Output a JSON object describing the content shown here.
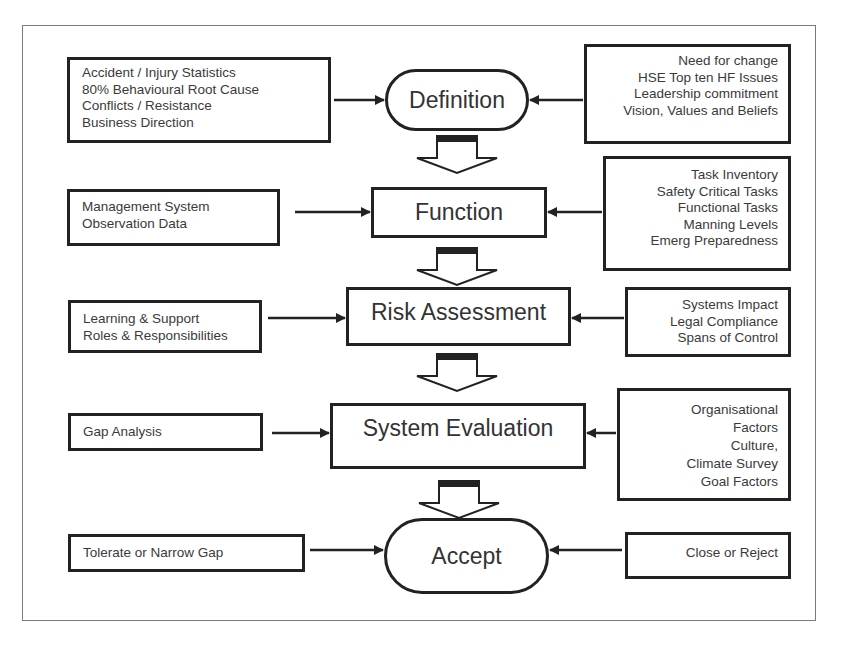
{
  "diagram": {
    "stages": [
      {
        "id": "definition",
        "label": "Definition",
        "shape": "pill",
        "left_inputs": [
          "Accident / Injury Statistics",
          "80% Behavioural Root Cause",
          "Conflicts / Resistance",
          "Business Direction"
        ],
        "right_inputs": [
          "Need for change",
          "HSE Top ten HF Issues",
          "Leadership commitment",
          "Vision, Values and Beliefs"
        ]
      },
      {
        "id": "function",
        "label": "Function",
        "shape": "rect",
        "left_inputs": [
          "Management System",
          "Observation Data"
        ],
        "right_inputs": [
          "Task Inventory",
          "Safety Critical Tasks",
          "Functional Tasks",
          "Manning Levels",
          "Emerg Preparedness"
        ]
      },
      {
        "id": "risk-assessment",
        "label": "Risk Assessment",
        "shape": "rect",
        "left_inputs": [
          "Learning & Support",
          "Roles & Responsibilities"
        ],
        "right_inputs": [
          "Systems Impact",
          "Legal Compliance",
          "Spans of Control"
        ]
      },
      {
        "id": "system-evaluation",
        "label": "System Evaluation",
        "shape": "rect",
        "left_inputs": [
          "Gap Analysis"
        ],
        "right_inputs": [
          "Organisational",
          "Factors",
          "Culture,",
          "Climate Survey",
          "Goal Factors"
        ]
      },
      {
        "id": "accept",
        "label": "Accept",
        "shape": "pill",
        "left_inputs": [
          "Tolerate or Narrow Gap"
        ],
        "right_inputs": [
          "Close or Reject"
        ]
      }
    ],
    "colors": {
      "stroke": "#222222",
      "text": "#333333",
      "frame": "#7a7a7a",
      "background": "#ffffff"
    }
  }
}
